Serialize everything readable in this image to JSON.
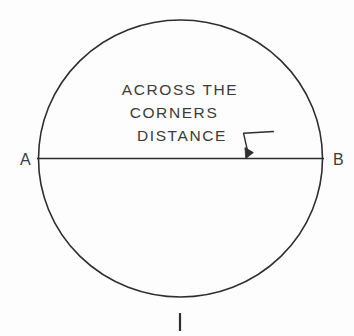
{
  "figure": {
    "background_color": "#fdfdfd",
    "ink_color": "#2e2e2e",
    "text_color": "#3b3b3b",
    "callout": {
      "line1": "ACROSS THE",
      "line2": "CORNERS",
      "line3": "DISTANCE"
    },
    "endpoints": {
      "left_label": "A",
      "right_label": "B"
    },
    "icons": {
      "leader_arrow": "leader-arrow-icon",
      "bottom_tick": "tick-mark-icon",
      "circle": "circle-outline-icon",
      "chord": "chord-line-icon"
    }
  }
}
